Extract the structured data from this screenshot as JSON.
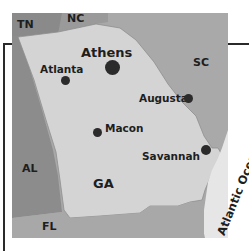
{
  "map": {
    "title": "Georgia",
    "colors": {
      "georgia": "#d4d4d4",
      "south_carolina": "#a9a9a9",
      "north_carolina": "#9a9a9a",
      "alabama": "#8c8c8c",
      "tennessee": "#8a8a8a",
      "florida": "#a8a8a8",
      "ocean": "#e6e6e6",
      "frame": "#2a2a2a",
      "city_dot": "#2b2b2b"
    },
    "states": {
      "tn": "TN",
      "nc": "NC",
      "sc": "SC",
      "al": "AL",
      "fl": "FL",
      "ga": "GA"
    },
    "cities": [
      {
        "name": "Athens",
        "emphasis": "large"
      },
      {
        "name": "Atlanta",
        "emphasis": "normal"
      },
      {
        "name": "Augusta",
        "emphasis": "normal"
      },
      {
        "name": "Macon",
        "emphasis": "normal"
      },
      {
        "name": "Savannah",
        "emphasis": "normal"
      }
    ],
    "water": {
      "ocean": "Atlantic Ocean"
    }
  }
}
